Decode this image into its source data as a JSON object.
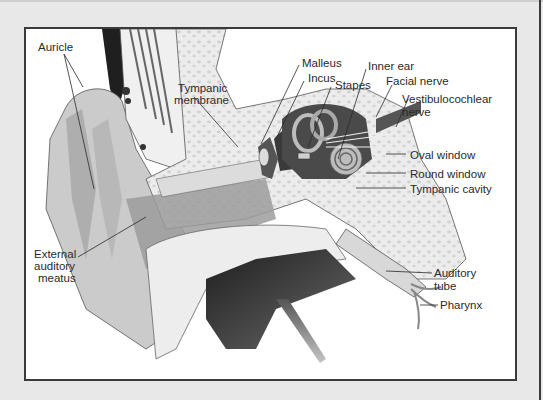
{
  "figure": {
    "labels": {
      "auricle": "Auricle",
      "tympanic_membrane_1": "Tympanic",
      "tympanic_membrane_2": "membrane",
      "malleus": "Malleus",
      "incus": "Incus",
      "stapes": "Stapes",
      "inner_ear": "Inner ear",
      "facial_nerve": "Facial nerve",
      "vestibulocochlear_nerve_1": "Vestibulocochlear",
      "vestibulocochlear_nerve_2": "nerve",
      "oval_window": "Oval window",
      "round_window": "Round window",
      "tympanic_cavity": "Tympanic cavity",
      "external_auditory_meatus_1": "External",
      "external_auditory_meatus_2": "auditory",
      "external_auditory_meatus_3": "meatus",
      "auditory_tube_1": "Auditory",
      "auditory_tube_2": "tube",
      "pharynx": "Pharynx"
    },
    "colors": {
      "page_bg": "#e8e8e8",
      "frame_border": "#3a3a3a",
      "frame_bg": "#ffffff",
      "bone_fill": "#e9e9e9",
      "skin_fill": "#c8c8c8",
      "canal_fill": "#9a9a9a",
      "dark_cavity": "#2e2e2e",
      "label_text": "#2a2a2a"
    }
  }
}
